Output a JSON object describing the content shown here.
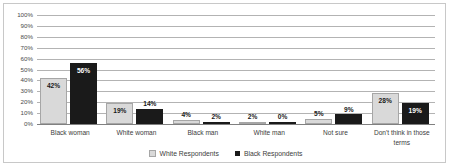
{
  "chart_data": {
    "type": "bar",
    "title": "",
    "xlabel": "",
    "ylabel": "",
    "ylim": [
      0,
      100
    ],
    "grid": true,
    "legend_position": "bottom",
    "categories": [
      "Black woman",
      "White woman",
      "Black man",
      "White man",
      "Not sure",
      "Don't think in those terms"
    ],
    "ytick_labels": [
      "100%",
      "90%",
      "80%",
      "70%",
      "60%",
      "50%",
      "40%",
      "30%",
      "20%",
      "10%",
      "0%"
    ],
    "ytick_values": [
      100,
      90,
      80,
      70,
      60,
      50,
      40,
      30,
      20,
      10,
      0
    ],
    "series": [
      {
        "name": "White Respondents",
        "color": "#d9d9d9",
        "values": [
          42,
          19,
          4,
          2,
          5,
          28
        ],
        "labels": [
          "42%",
          "19%",
          "4%",
          "2%",
          "5%",
          "28%"
        ]
      },
      {
        "name": "Black Respondents",
        "color": "#1a1a1a",
        "values": [
          56,
          14,
          2,
          0,
          9,
          19
        ],
        "labels": [
          "56%",
          "14%",
          "2%",
          "0%",
          "9%",
          "19%"
        ]
      }
    ]
  }
}
